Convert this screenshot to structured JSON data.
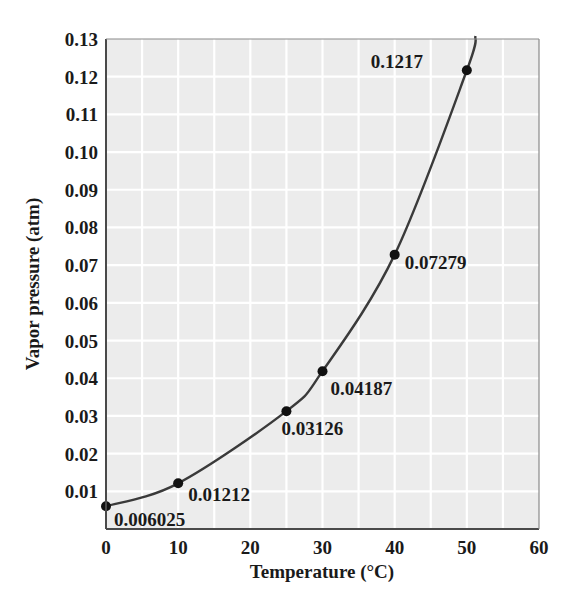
{
  "chart_data": {
    "type": "line",
    "title": "",
    "xlabel": "Temperature (°C)",
    "ylabel": "Vapor pressure (atm)",
    "xlim": [
      0,
      60
    ],
    "ylim": [
      0,
      0.13
    ],
    "grid": true,
    "legend": null,
    "x_ticks": [
      "0",
      "10",
      "20",
      "30",
      "40",
      "50",
      "60"
    ],
    "y_ticks": [
      "0.01",
      "0.02",
      "0.03",
      "0.04",
      "0.05",
      "0.06",
      "0.07",
      "0.08",
      "0.09",
      "0.10",
      "0.11",
      "0.12",
      "0.13"
    ],
    "series": [
      {
        "name": "Vapor pressure of water",
        "x": [
          0,
          10,
          25,
          30,
          40,
          50
        ],
        "values": [
          0.006025,
          0.01212,
          0.03126,
          0.04187,
          0.07279,
          0.1217
        ],
        "labels": [
          "0.006025",
          "0.01212",
          "0.03126",
          "0.04187",
          "0.07279",
          "0.1217"
        ]
      }
    ]
  },
  "colors": {
    "plot_background": "#ececec",
    "grid": "#ffffff",
    "curve": "#3a3a3a",
    "points": "#111111",
    "text": "#1a1a1a"
  }
}
